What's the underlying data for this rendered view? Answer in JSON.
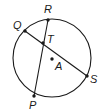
{
  "diagram": {
    "type": "circle-with-intersecting-chords",
    "circle": {
      "center_label": "A",
      "cx": 52,
      "cy": 58,
      "r": 39
    },
    "points": [
      {
        "id": "Q",
        "label": "Q",
        "x": 25,
        "y": 31,
        "lx": 13,
        "ly": 29
      },
      {
        "id": "R",
        "label": "R",
        "x": 48,
        "y": 20,
        "lx": 44,
        "ly": 13
      },
      {
        "id": "T",
        "label": "T",
        "x": 43,
        "y": 43,
        "lx": 47,
        "ly": 43
      },
      {
        "id": "A",
        "label": "A",
        "x": 52,
        "y": 59,
        "lx": 55,
        "ly": 70
      },
      {
        "id": "S",
        "label": "S",
        "x": 87,
        "y": 76,
        "lx": 90,
        "ly": 83
      },
      {
        "id": "P",
        "label": "P",
        "x": 34,
        "y": 96,
        "lx": 29,
        "ly": 109
      }
    ],
    "chords": [
      {
        "name": "QS",
        "from": "Q",
        "to": "S"
      },
      {
        "name": "RP",
        "from": "R",
        "to": "P"
      }
    ],
    "intersection": "T",
    "stroke_color": "#1a1a1a"
  }
}
